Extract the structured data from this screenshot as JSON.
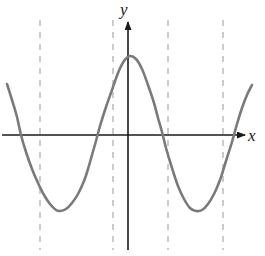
{
  "figure": {
    "title": "",
    "background_color": "#ffffff",
    "width": 265,
    "height": 256
  },
  "labels": {
    "y_axis": "y",
    "x_axis": "x"
  },
  "watermark": {
    "text": " "
  },
  "colors": {
    "curve": "#7a7a7a",
    "axis": "#1a1a1a",
    "dashed_line": "#b0b0b0",
    "label": "#1a1a1a"
  },
  "chart_data": {
    "type": "line",
    "title": "",
    "xlabel": "x",
    "ylabel": "y",
    "grid": false,
    "legend": null,
    "axes": {
      "x_axis_y_pixel": 135,
      "y_axis_x_pixel": 128,
      "x_axis_start_pixel": 2,
      "x_axis_end_pixel": 245,
      "y_axis_top_pixel": 20,
      "y_axis_bottom_pixel": 250,
      "x_arrow": true,
      "y_arrow": true
    },
    "curve": {
      "name": "f(x)",
      "style": "solid",
      "color": "#7a7a7a",
      "width": 2.6,
      "points_pixel": [
        [
          7,
          84
        ],
        [
          12,
          100
        ],
        [
          17,
          117
        ],
        [
          21,
          135
        ],
        [
          26,
          152
        ],
        [
          32,
          169
        ],
        [
          38,
          183
        ],
        [
          44,
          195
        ],
        [
          50,
          204
        ],
        [
          56,
          210
        ],
        [
          60,
          211
        ],
        [
          66,
          209
        ],
        [
          72,
          203
        ],
        [
          78,
          194
        ],
        [
          84,
          181
        ],
        [
          88,
          169
        ],
        [
          92,
          155
        ],
        [
          96,
          141
        ],
        [
          100,
          126
        ],
        [
          106,
          107
        ],
        [
          112,
          90
        ],
        [
          118,
          73
        ],
        [
          124,
          61
        ],
        [
          130,
          56
        ],
        [
          136,
          59
        ],
        [
          142,
          69
        ],
        [
          148,
          85
        ],
        [
          154,
          103
        ],
        [
          158,
          118
        ],
        [
          162,
          132
        ],
        [
          166,
          148
        ],
        [
          172,
          168
        ],
        [
          178,
          186
        ],
        [
          184,
          199
        ],
        [
          190,
          208
        ],
        [
          196,
          211
        ],
        [
          202,
          210
        ],
        [
          208,
          204
        ],
        [
          214,
          194
        ],
        [
          220,
          180
        ],
        [
          226,
          161
        ],
        [
          232,
          142
        ],
        [
          237,
          124
        ],
        [
          242,
          108
        ],
        [
          247,
          95
        ],
        [
          252,
          85
        ]
      ],
      "key_points": {
        "local_max_pixel": [
          130,
          56
        ],
        "left_min_pixel": [
          59,
          211
        ],
        "right_min_pixel": [
          197,
          211
        ],
        "x_intercepts_pixel": [
          21,
          88,
          157,
          238
        ]
      }
    },
    "dashed_vertical_lines": [
      {
        "x_pixel": 40,
        "y_top": 20,
        "y_bottom": 250
      },
      {
        "x_pixel": 113,
        "y_top": 20,
        "y_bottom": 250
      },
      {
        "x_pixel": 168,
        "y_top": 20,
        "y_bottom": 250
      },
      {
        "x_pixel": 223,
        "y_top": 20,
        "y_bottom": 250
      }
    ]
  }
}
